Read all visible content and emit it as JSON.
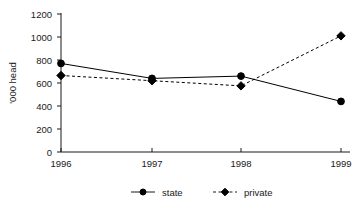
{
  "chart_data": {
    "type": "line",
    "title": "",
    "xlabel": "",
    "ylabel": "'000 head",
    "categories": [
      "1996",
      "1997",
      "1998",
      "1999"
    ],
    "ylim": [
      0,
      1200
    ],
    "yticks": [
      0,
      200,
      400,
      600,
      800,
      1000,
      1200
    ],
    "ytick_labels": [
      "0",
      "200",
      "400",
      "600",
      "800",
      "1000",
      "1200"
    ],
    "grid": false,
    "legend_position": "bottom",
    "series": [
      {
        "name": "state",
        "values": [
          770,
          640,
          660,
          440
        ],
        "line_style": "solid",
        "marker": "circle",
        "color": "#000000"
      },
      {
        "name": "private",
        "values": [
          665,
          620,
          575,
          1010
        ],
        "line_style": "dashed",
        "marker": "diamond",
        "color": "#000000"
      }
    ]
  },
  "axes": {
    "y_title": "'000 head",
    "y_tick_0": "0",
    "y_tick_1": "200",
    "y_tick_2": "400",
    "y_tick_3": "600",
    "y_tick_4": "800",
    "y_tick_5": "1000",
    "y_tick_6": "1200",
    "x_tick_0": "1996",
    "x_tick_1": "1997",
    "x_tick_2": "1998",
    "x_tick_3": "1999"
  },
  "legend": {
    "entry_0": "state",
    "entry_1": "private"
  }
}
